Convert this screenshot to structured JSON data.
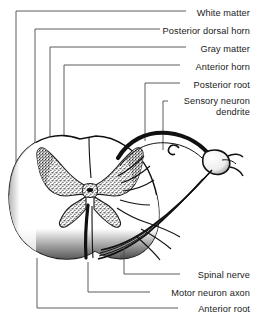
{
  "figure": {
    "width": 257,
    "height": 319,
    "background_color": "#ffffff",
    "ink_color": "#1a1a1a",
    "leader_color": "#4a4a4a"
  },
  "labels": [
    {
      "id": "white-matter",
      "text": "White matter",
      "x": 250,
      "y": 14,
      "anchor": "right"
    },
    {
      "id": "posterior-dorsal-horn",
      "text": "Posterior dorsal horn",
      "x": 250,
      "y": 32,
      "anchor": "right"
    },
    {
      "id": "gray-matter",
      "text": "Gray matter",
      "x": 250,
      "y": 50,
      "anchor": "right"
    },
    {
      "id": "anterior-horn",
      "text": "Anterior horn",
      "x": 250,
      "y": 68,
      "anchor": "right"
    },
    {
      "id": "posterior-root",
      "text": "Posterior root",
      "x": 250,
      "y": 86,
      "anchor": "right"
    },
    {
      "id": "sensory-neuron-dendrite",
      "text": "Sensory neuron dendrite",
      "x": 250,
      "y": 104,
      "anchor": "right",
      "lines": 2
    },
    {
      "id": "spinal-nerve",
      "text": "Spinal nerve",
      "x": 250,
      "y": 277,
      "anchor": "right"
    },
    {
      "id": "motor-neuron-axon",
      "text": "Motor neuron axon",
      "x": 250,
      "y": 295,
      "anchor": "right"
    },
    {
      "id": "anterior-root",
      "text": "Anterior root",
      "x": 250,
      "y": 311,
      "anchor": "right"
    }
  ],
  "structures": [
    {
      "id": "white-matter",
      "description": "Outer shaded region of the cord"
    },
    {
      "id": "gray-matter",
      "description": "Central stippled butterfly-shaped region"
    },
    {
      "id": "central-canal",
      "description": "Small opening at the centre of the gray matter"
    },
    {
      "id": "posterior-horn",
      "description": "Dorsal projection of the gray matter"
    },
    {
      "id": "anterior-horn",
      "description": "Ventral projection of the gray matter"
    },
    {
      "id": "posterior-root",
      "description": "Dorsal root arcing to the ganglion"
    },
    {
      "id": "dorsal-root-ganglion",
      "description": "Bulbous swelling on the posterior root"
    },
    {
      "id": "spinal-nerve",
      "description": "Combined nerve trunk lateral to the cord"
    },
    {
      "id": "anterior-root",
      "description": "Ventral root leaving the anterior horn"
    }
  ]
}
